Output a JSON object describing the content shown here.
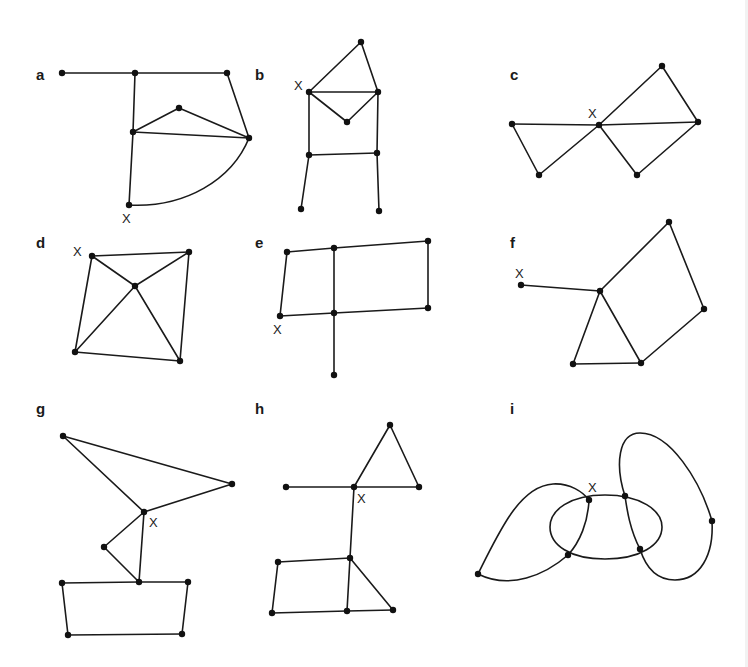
{
  "figure": {
    "ink_color": "#1a1a1a",
    "background": "#ffffff",
    "start_marker": "X",
    "panels": [
      {
        "id": "a",
        "label": "a",
        "label_pos": [
          36,
          80
        ],
        "x_label_pos": [
          122,
          223
        ],
        "nodes": [
          [
            62,
            73
          ],
          [
            135,
            73
          ],
          [
            227,
            73
          ],
          [
            179,
            108
          ],
          [
            133,
            132
          ],
          [
            249,
            138
          ],
          [
            129,
            205
          ]
        ],
        "edges": [
          [
            0,
            1
          ],
          [
            1,
            2
          ],
          [
            2,
            5
          ],
          [
            1,
            4
          ],
          [
            4,
            3
          ],
          [
            3,
            5
          ],
          [
            4,
            5
          ],
          [
            4,
            6
          ]
        ],
        "curves": [
          "M129,205 C185,208 232,180 249,138"
        ]
      },
      {
        "id": "b",
        "label": "b",
        "label_pos": [
          255,
          80
        ],
        "x_label_pos": [
          294,
          90
        ],
        "nodes": [
          [
            361,
            42
          ],
          [
            309,
            92
          ],
          [
            378,
            92
          ],
          [
            347,
            122
          ],
          [
            309,
            155
          ],
          [
            377,
            153
          ],
          [
            301,
            209
          ],
          [
            379,
            211
          ]
        ],
        "edges": [
          [
            0,
            1
          ],
          [
            0,
            2
          ],
          [
            1,
            2
          ],
          [
            1,
            3
          ],
          [
            3,
            2
          ],
          [
            1,
            4
          ],
          [
            2,
            5
          ],
          [
            4,
            5
          ],
          [
            4,
            6
          ],
          [
            5,
            7
          ]
        ],
        "curves": []
      },
      {
        "id": "c",
        "label": "c",
        "label_pos": [
          510,
          80
        ],
        "x_label_pos": [
          588,
          118
        ],
        "nodes": [
          [
            512,
            124
          ],
          [
            599,
            125
          ],
          [
            698,
            122
          ],
          [
            662,
            66
          ],
          [
            539,
            175
          ],
          [
            637,
            175
          ]
        ],
        "edges": [
          [
            0,
            1
          ],
          [
            1,
            2
          ],
          [
            0,
            4
          ],
          [
            4,
            1
          ],
          [
            1,
            3
          ],
          [
            3,
            2
          ],
          [
            1,
            5
          ],
          [
            5,
            2
          ]
        ],
        "curves": []
      },
      {
        "id": "d",
        "label": "d",
        "label_pos": [
          36,
          248
        ],
        "x_label_pos": [
          73,
          256
        ],
        "nodes": [
          [
            92,
            256
          ],
          [
            189,
            252
          ],
          [
            135,
            286
          ],
          [
            75,
            352
          ],
          [
            180,
            361
          ]
        ],
        "edges": [
          [
            0,
            1
          ],
          [
            0,
            3
          ],
          [
            1,
            4
          ],
          [
            3,
            4
          ],
          [
            0,
            2
          ],
          [
            1,
            2
          ],
          [
            3,
            2
          ],
          [
            4,
            2
          ]
        ],
        "curves": []
      },
      {
        "id": "e",
        "label": "e",
        "label_pos": [
          255,
          248
        ],
        "x_label_pos": [
          273,
          334
        ],
        "nodes": [
          [
            287,
            252
          ],
          [
            334,
            248
          ],
          [
            428,
            241
          ],
          [
            280,
            316
          ],
          [
            334,
            313
          ],
          [
            428,
            308
          ],
          [
            334,
            375
          ]
        ],
        "edges": [
          [
            0,
            1
          ],
          [
            1,
            2
          ],
          [
            0,
            3
          ],
          [
            3,
            4
          ],
          [
            4,
            5
          ],
          [
            2,
            5
          ],
          [
            1,
            4
          ],
          [
            4,
            6
          ]
        ],
        "curves": []
      },
      {
        "id": "f",
        "label": "f",
        "label_pos": [
          510,
          248
        ],
        "x_label_pos": [
          515,
          278
        ],
        "nodes": [
          [
            521,
            285
          ],
          [
            600,
            291
          ],
          [
            669,
            222
          ],
          [
            704,
            309
          ],
          [
            573,
            364
          ],
          [
            641,
            363
          ]
        ],
        "edges": [
          [
            0,
            1
          ],
          [
            1,
            2
          ],
          [
            2,
            3
          ],
          [
            3,
            5
          ],
          [
            1,
            4
          ],
          [
            1,
            5
          ],
          [
            4,
            5
          ]
        ],
        "curves": []
      },
      {
        "id": "g",
        "label": "g",
        "label_pos": [
          36,
          414
        ],
        "x_label_pos": [
          149,
          527
        ],
        "nodes": [
          [
            63,
            436
          ],
          [
            232,
            484
          ],
          [
            144,
            512
          ],
          [
            104,
            547
          ],
          [
            139,
            582
          ],
          [
            62,
            583
          ],
          [
            188,
            582
          ],
          [
            68,
            635
          ],
          [
            182,
            634
          ]
        ],
        "edges": [
          [
            0,
            1
          ],
          [
            0,
            2
          ],
          [
            1,
            2
          ],
          [
            2,
            3
          ],
          [
            3,
            4
          ],
          [
            2,
            4
          ],
          [
            5,
            4
          ],
          [
            4,
            6
          ],
          [
            5,
            7
          ],
          [
            6,
            8
          ],
          [
            7,
            8
          ]
        ],
        "curves": []
      },
      {
        "id": "h",
        "label": "h",
        "label_pos": [
          255,
          414
        ],
        "x_label_pos": [
          357,
          503
        ],
        "nodes": [
          [
            286,
            487
          ],
          [
            354,
            487
          ],
          [
            419,
            487
          ],
          [
            390,
            425
          ],
          [
            350,
            558
          ],
          [
            278,
            562
          ],
          [
            272,
            613
          ],
          [
            347,
            611
          ],
          [
            393,
            610
          ]
        ],
        "edges": [
          [
            0,
            1
          ],
          [
            1,
            2
          ],
          [
            1,
            3
          ],
          [
            3,
            2
          ],
          [
            1,
            4
          ],
          [
            5,
            4
          ],
          [
            5,
            6
          ],
          [
            6,
            7
          ],
          [
            7,
            8
          ],
          [
            4,
            7
          ],
          [
            4,
            8
          ]
        ],
        "curves": []
      },
      {
        "id": "i",
        "label": "i",
        "label_pos": [
          510,
          414
        ],
        "x_label_pos": [
          588,
          492
        ],
        "nodes": [
          [
            478,
            574
          ],
          [
            589,
            500
          ],
          [
            568,
            555
          ],
          [
            625,
            496
          ],
          [
            640,
            549
          ],
          [
            712,
            521
          ]
        ],
        "edges": [],
        "curves": [
          "M605,495 C640,495 662,510 662,527 C662,545 640,559 605,559 C570,559 550,545 550,527 C550,510 570,495 605,495 Z",
          "M478,574 C500,530 520,486 553,484 C570,483 583,492 589,500",
          "M589,500 C588,522 580,542 568,555",
          "M568,555 C545,575 510,590 478,574",
          "M625,496 C615,465 618,433 640,433 C670,433 700,480 712,521",
          "M712,521 C714,555 700,580 675,580 C655,580 645,565 640,549",
          "M640,549 C630,530 627,510 625,496"
        ]
      }
    ]
  }
}
